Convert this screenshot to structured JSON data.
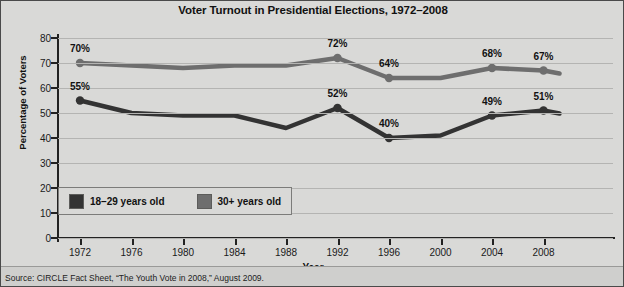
{
  "chart_data": {
    "type": "line",
    "title": "Voter Turnout in Presidential Elections, 1972–2008",
    "xlabel": "Year",
    "ylabel": "Percentage of Voters",
    "x": [
      1972,
      1976,
      1980,
      1984,
      1988,
      1992,
      1996,
      2000,
      2004,
      2008
    ],
    "xticks": [
      "1972",
      "1976",
      "1980",
      "1984",
      "1988",
      "1992",
      "1996",
      "2000",
      "2004",
      "2008"
    ],
    "yticks": [
      "0",
      "10",
      "20",
      "30",
      "40",
      "50",
      "60",
      "70",
      "80"
    ],
    "ylim": [
      0,
      80
    ],
    "xlim": [
      1972,
      2008
    ],
    "grid": true,
    "legend_position": "inside-bottom-left",
    "series": [
      {
        "name": "18–29 years old",
        "color": "#333333",
        "values": [
          55,
          50,
          49,
          49,
          44,
          52,
          40,
          41,
          49,
          51
        ],
        "labels": [
          "55%",
          "",
          "",
          "",
          "",
          "52%",
          "40%",
          "",
          "49%",
          "51%"
        ]
      },
      {
        "name": "30+ years old",
        "color": "#6e6e6e",
        "values": [
          70,
          69,
          68,
          69,
          69,
          72,
          64,
          64,
          68,
          67
        ],
        "labels": [
          "70%",
          "",
          "",
          "",
          "",
          "72%",
          "64%",
          "",
          "68%",
          "67%"
        ]
      }
    ],
    "source": "Source: CIRCLE Fact Sheet, “The Youth Vote in 2008,” August 2009."
  },
  "legend": {
    "items": [
      {
        "label": "18–29 years old",
        "color": "#333333"
      },
      {
        "label": "30+ years old",
        "color": "#6e6e6e"
      }
    ]
  }
}
